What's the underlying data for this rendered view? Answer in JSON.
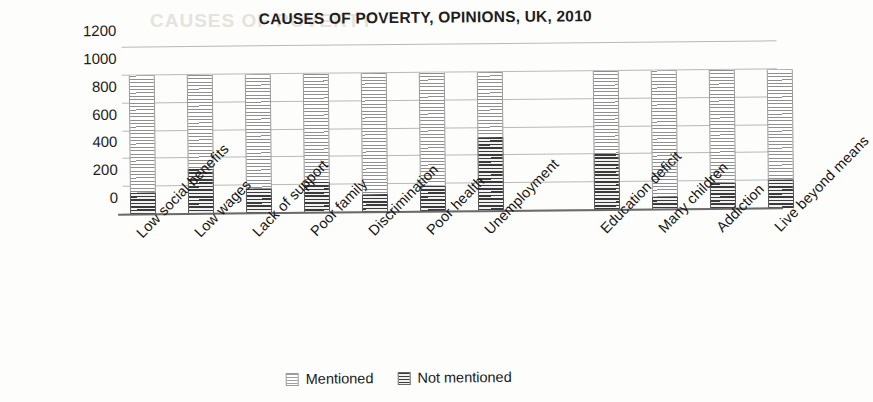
{
  "chart_data": {
    "type": "bar",
    "subtype": "stacked-bar",
    "title": "CAUSES OF POVERTY, OPINIONS, UK, 2010",
    "xlabel": "",
    "ylabel": "",
    "ylim": [
      0,
      1200
    ],
    "yticks": [
      0,
      200,
      400,
      600,
      800,
      1000,
      1200
    ],
    "ytick_labels": [
      "0",
      "200",
      "400",
      "600",
      "800",
      "1000",
      "1200"
    ],
    "grid": true,
    "legend_position": "bottom",
    "categories": [
      "Low social benefits",
      "Low wages",
      "Lack of support",
      "Poor family",
      "Discrimination",
      "Poor health",
      "Unemployment",
      "Education deficit",
      "Many children",
      "Addiction",
      "Live beyond means"
    ],
    "series": [
      {
        "name": "Not mentioned",
        "style": "dark-hatched",
        "color": "#3a3a3a",
        "values": [
          160,
          320,
          180,
          220,
          130,
          190,
          530,
          400,
          90,
          190,
          210
        ]
      },
      {
        "name": "Mentioned",
        "style": "light-hatched",
        "color": "#8f8f8f",
        "values": [
          840,
          680,
          820,
          780,
          870,
          810,
          470,
          600,
          910,
          810,
          790
        ]
      }
    ],
    "total_per_category": [
      1000,
      1000,
      1000,
      1000,
      1000,
      1000,
      1000,
      1000,
      1000,
      1000,
      1000
    ]
  },
  "legend": {
    "items": [
      {
        "label": "Mentioned",
        "swatch": "light"
      },
      {
        "label": "Not mentioned",
        "swatch": "dark"
      }
    ]
  },
  "ghost_text": "CAUSES OF POVERTY"
}
